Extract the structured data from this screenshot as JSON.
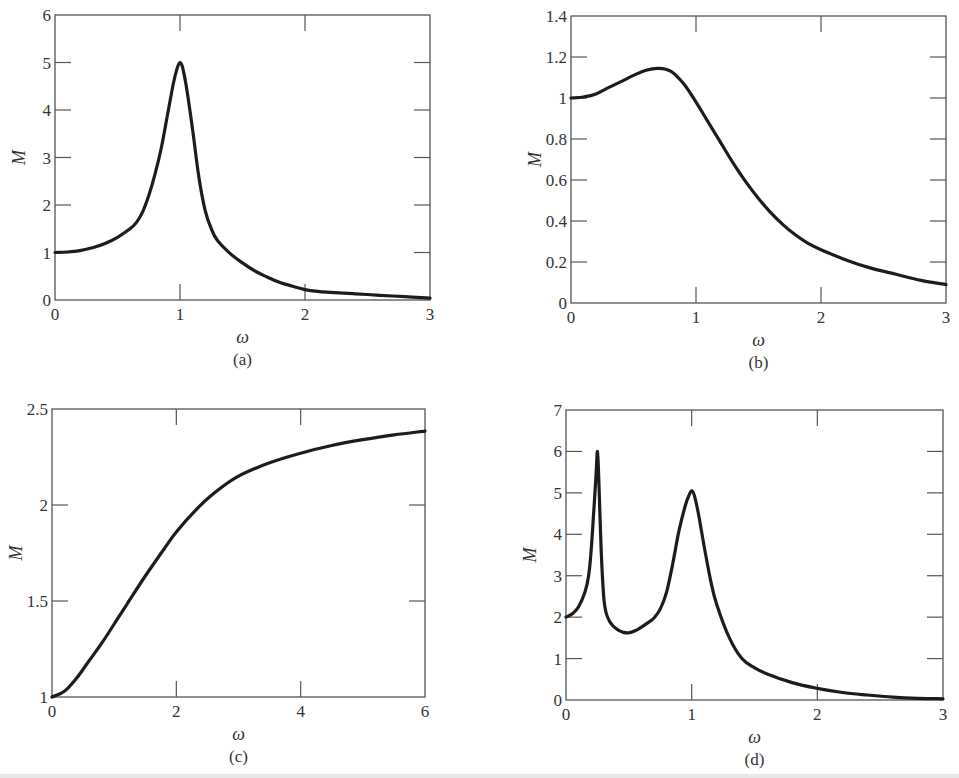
{
  "figure": {
    "colors": {
      "curve": "#1c1c1c",
      "frame": "#555555",
      "text": "#333333",
      "background": "#ffffff"
    }
  },
  "chart_data": [
    {
      "id": "a",
      "type": "line",
      "title": "",
      "sublabel": "(a)",
      "xlabel": "ω",
      "ylabel": "M",
      "xlim": [
        0,
        3
      ],
      "ylim": [
        0,
        6
      ],
      "xticks": [
        0,
        1,
        2,
        3
      ],
      "yticks": [
        0,
        1,
        2,
        3,
        4,
        5,
        6
      ],
      "xtick_labels": [
        "0",
        "1",
        "2",
        "3"
      ],
      "ytick_labels": [
        "0",
        "1",
        "2",
        "3",
        "4",
        "5",
        "6"
      ],
      "grid": false,
      "frame_px": {
        "left": 55,
        "top": 15,
        "right": 430,
        "bottom": 300
      },
      "series": [
        {
          "name": "M(ω)",
          "x": [
            0,
            0.1,
            0.2,
            0.3,
            0.4,
            0.5,
            0.6,
            0.65,
            0.7,
            0.75,
            0.8,
            0.85,
            0.9,
            0.95,
            0.98,
            1.0,
            1.02,
            1.05,
            1.1,
            1.15,
            1.2,
            1.25,
            1.3,
            1.4,
            1.5,
            1.6,
            1.7,
            1.8,
            1.9,
            2.0,
            2.1,
            2.2,
            2.4,
            2.6,
            2.8,
            3.0
          ],
          "y": [
            1.0,
            1.01,
            1.04,
            1.1,
            1.19,
            1.32,
            1.5,
            1.63,
            1.85,
            2.2,
            2.65,
            3.2,
            3.9,
            4.6,
            4.9,
            5.0,
            4.9,
            4.5,
            3.6,
            2.6,
            1.9,
            1.5,
            1.25,
            0.98,
            0.78,
            0.61,
            0.48,
            0.37,
            0.29,
            0.22,
            0.18,
            0.16,
            0.13,
            0.1,
            0.07,
            0.04
          ]
        }
      ]
    },
    {
      "id": "b",
      "type": "line",
      "title": "",
      "sublabel": "(b)",
      "xlabel": "ω",
      "ylabel": "M",
      "xlim": [
        0,
        3
      ],
      "ylim": [
        0,
        1.4
      ],
      "xticks": [
        0,
        1,
        2,
        3
      ],
      "yticks": [
        0,
        0.2,
        0.4,
        0.6,
        0.8,
        1,
        1.2,
        1.4
      ],
      "xtick_labels": [
        "0",
        "1",
        "2",
        "3"
      ],
      "ytick_labels": [
        "0",
        "0.2",
        "0.4",
        "0.6",
        "0.8",
        "1",
        "1.2",
        "1.4"
      ],
      "grid": false,
      "frame_px": {
        "left": 571,
        "top": 16,
        "right": 946,
        "bottom": 303
      },
      "series": [
        {
          "name": "M(ω)",
          "x": [
            0,
            0.1,
            0.2,
            0.3,
            0.4,
            0.5,
            0.6,
            0.7,
            0.8,
            0.9,
            1.0,
            1.1,
            1.2,
            1.3,
            1.4,
            1.5,
            1.6,
            1.7,
            1.8,
            1.9,
            2.0,
            2.2,
            2.4,
            2.6,
            2.8,
            3.0
          ],
          "y": [
            1.0,
            1.005,
            1.02,
            1.05,
            1.08,
            1.11,
            1.135,
            1.145,
            1.13,
            1.07,
            0.98,
            0.88,
            0.78,
            0.68,
            0.59,
            0.51,
            0.44,
            0.38,
            0.33,
            0.29,
            0.26,
            0.21,
            0.17,
            0.14,
            0.11,
            0.09
          ]
        }
      ]
    },
    {
      "id": "c",
      "type": "line",
      "title": "",
      "sublabel": "(c)",
      "xlabel": "ω",
      "ylabel": "M",
      "xlim": [
        0,
        6
      ],
      "ylim": [
        1,
        2.5
      ],
      "xticks": [
        0,
        2,
        4,
        6
      ],
      "yticks": [
        1,
        1.5,
        2,
        2.5
      ],
      "xtick_labels": [
        "0",
        "2",
        "4",
        "6"
      ],
      "ytick_labels": [
        "1",
        "1.5",
        "2",
        "2.5"
      ],
      "grid": false,
      "frame_px": {
        "left": 52,
        "top": 409,
        "right": 425,
        "bottom": 697
      },
      "series": [
        {
          "name": "M(ω)",
          "x": [
            0,
            0.2,
            0.4,
            0.6,
            0.8,
            1.0,
            1.2,
            1.5,
            1.8,
            2.0,
            2.3,
            2.6,
            3.0,
            3.5,
            4.0,
            4.5,
            5.0,
            5.5,
            6.0
          ],
          "y": [
            1.0,
            1.03,
            1.1,
            1.19,
            1.28,
            1.38,
            1.48,
            1.63,
            1.77,
            1.86,
            1.97,
            2.06,
            2.15,
            2.22,
            2.27,
            2.31,
            2.34,
            2.365,
            2.385
          ]
        }
      ]
    },
    {
      "id": "d",
      "type": "line",
      "title": "",
      "sublabel": "(d)",
      "xlabel": "ω",
      "ylabel": "M",
      "xlim": [
        0,
        3
      ],
      "ylim": [
        0,
        7
      ],
      "xticks": [
        0,
        1,
        2,
        3
      ],
      "yticks": [
        0,
        1,
        2,
        3,
        4,
        5,
        6,
        7
      ],
      "xtick_labels": [
        "0",
        "1",
        "2",
        "3"
      ],
      "ytick_labels": [
        "0",
        "1",
        "2",
        "3",
        "4",
        "5",
        "6",
        "7"
      ],
      "grid": false,
      "frame_px": {
        "left": 566,
        "top": 410,
        "right": 943,
        "bottom": 700
      },
      "series": [
        {
          "name": "M(ω)",
          "x": [
            0,
            0.05,
            0.1,
            0.15,
            0.18,
            0.2,
            0.22,
            0.24,
            0.25,
            0.26,
            0.28,
            0.3,
            0.32,
            0.35,
            0.4,
            0.45,
            0.5,
            0.55,
            0.6,
            0.65,
            0.7,
            0.75,
            0.8,
            0.85,
            0.9,
            0.95,
            0.98,
            1.0,
            1.02,
            1.05,
            1.1,
            1.15,
            1.2,
            1.3,
            1.4,
            1.5,
            1.6,
            1.8,
            2.0,
            2.2,
            2.4,
            2.6,
            2.8,
            3.0
          ],
          "y": [
            2.0,
            2.08,
            2.25,
            2.6,
            3.0,
            3.6,
            4.5,
            5.5,
            6.0,
            5.4,
            3.6,
            2.5,
            2.1,
            1.88,
            1.72,
            1.64,
            1.62,
            1.67,
            1.76,
            1.86,
            1.98,
            2.2,
            2.6,
            3.3,
            4.1,
            4.7,
            4.95,
            5.05,
            4.95,
            4.55,
            3.7,
            2.9,
            2.3,
            1.5,
            1.0,
            0.78,
            0.63,
            0.42,
            0.28,
            0.18,
            0.12,
            0.07,
            0.04,
            0.03
          ]
        }
      ]
    }
  ]
}
